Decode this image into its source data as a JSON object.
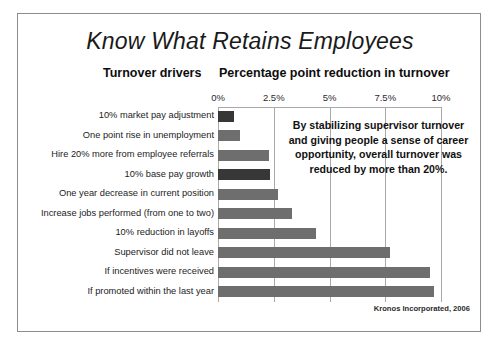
{
  "slide": {
    "title": "Know What Retains Employees",
    "column_heading_left": "Turnover drivers",
    "column_heading_right": "Percentage point reduction in turnover",
    "callout": "By stabilizing supervisor turnover and giving people a sense of career opportunity, overall turnover was reduced by more than 20%.",
    "source": "Kronos Incorporated, 2006"
  },
  "colors": {
    "frame_border": "#8d8d8d",
    "bar_default": "#6e6e6e",
    "bar_highlight": "#373737",
    "gridline": "#a9a9a9",
    "text": "#1a1a1a",
    "background": "#ffffff"
  },
  "chart_data": {
    "type": "bar",
    "orientation": "horizontal",
    "title": "Know What Retains Employees",
    "xlabel": "Percentage point reduction in turnover",
    "ylabel": "Turnover drivers",
    "xlim": [
      0,
      10
    ],
    "grid": true,
    "legend": "none",
    "tick_labels": [
      "0%",
      "2.5%",
      "5%",
      "7.5%",
      "10%"
    ],
    "tick_values": [
      0,
      2.5,
      5,
      7.5,
      10
    ],
    "categories": [
      "10% market pay adjustment",
      "One point rise in unemployment",
      "Hire 20% more from employee referrals",
      "10% base pay growth",
      "One year decrease in current position",
      "Increase jobs performed (from one to two)",
      "10% reduction in layoffs",
      "Supervisor did not leave",
      "If incentives were received",
      "If promoted within the last year"
    ],
    "values": [
      0.7,
      1.0,
      2.3,
      2.35,
      2.7,
      3.3,
      4.4,
      7.7,
      9.5,
      9.7
    ],
    "highlighted": [
      0,
      3
    ],
    "annotations": [
      "By stabilizing supervisor turnover and giving people a sense of career opportunity, overall turnover was reduced by more than 20%."
    ],
    "source": "Kronos Incorporated, 2006"
  }
}
